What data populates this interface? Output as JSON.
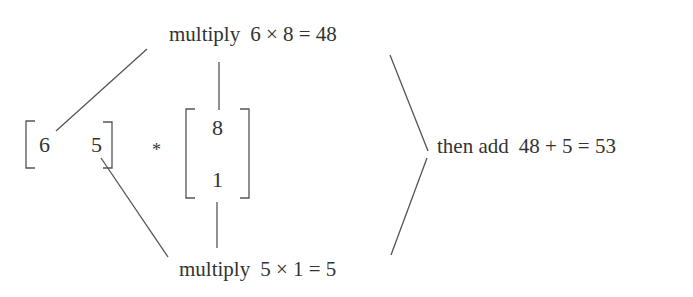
{
  "diagram": {
    "row_vector": {
      "values": [
        "6",
        "5"
      ]
    },
    "operator": "*",
    "column_vector": {
      "values": [
        "8",
        "1"
      ]
    },
    "steps": [
      {
        "label": "multiply",
        "expression": "6 × 8 = 48"
      },
      {
        "label": "multiply",
        "expression": "5 × 1 = 5"
      }
    ],
    "result": {
      "label": "then add",
      "expression": "48 + 5 = 53"
    }
  },
  "colors": {
    "ink": "#333333",
    "background": "#ffffff",
    "line": "#555555"
  }
}
